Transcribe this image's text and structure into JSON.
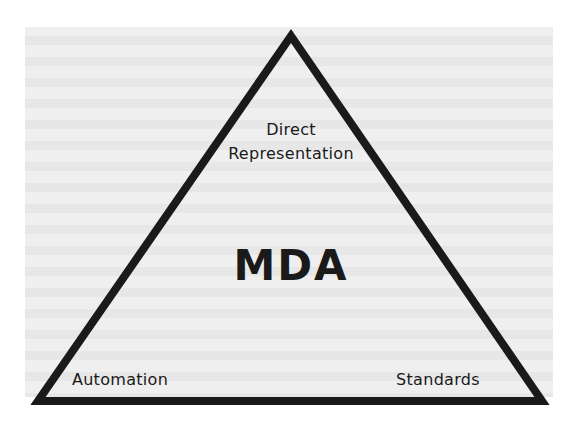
{
  "diagram": {
    "type": "triangle",
    "center_label": "MDA",
    "vertices": {
      "top": {
        "lines": [
          "Direct",
          "Representation"
        ]
      },
      "bottom_left": {
        "label": "Automation"
      },
      "bottom_right": {
        "label": "Standards"
      }
    }
  },
  "colors": {
    "page_background": "#ffffff",
    "panel_background": "#efefef",
    "stroke": "#1a1a1a",
    "text": "#1a1a1a"
  }
}
